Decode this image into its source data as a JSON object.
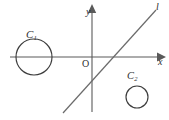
{
  "figure": {
    "background_color": "#ffffff",
    "width": 169,
    "height": 120
  },
  "axes": {
    "x_axis": {
      "label": "x",
      "icon": "axis-arrow-right-icon",
      "color": "#5a5a5a",
      "y_pixel": 57,
      "x_start": 10,
      "x_end": 156
    },
    "y_axis": {
      "label": "y",
      "icon": "axis-arrow-up-icon",
      "color": "#5a5a5a",
      "x_pixel": 92,
      "y_start": 12,
      "y_end": 112
    },
    "origin": {
      "label": "O",
      "x_pixel": 92,
      "y_pixel": 57
    }
  },
  "line": {
    "label": "l",
    "color": "#6b6b6b",
    "x1": 63,
    "y1": 112,
    "x2": 156,
    "y2": 10,
    "x_intercept_pixel": 105,
    "description": "Slanted line rising from lower-left to upper-right"
  },
  "circles": [
    {
      "label": "C",
      "subscript": "1",
      "full_label": "C1",
      "center_x": 34,
      "center_y": 57,
      "radius": 18,
      "color": "#3d3d3d",
      "position_note": "Left of y-axis, centered on the x-axis"
    },
    {
      "label": "C",
      "subscript": "2",
      "full_label": "C2",
      "center_x": 137,
      "center_y": 97,
      "radius": 11,
      "color": "#3d3d3d",
      "position_note": "Right of y-axis, below the x-axis"
    }
  ]
}
